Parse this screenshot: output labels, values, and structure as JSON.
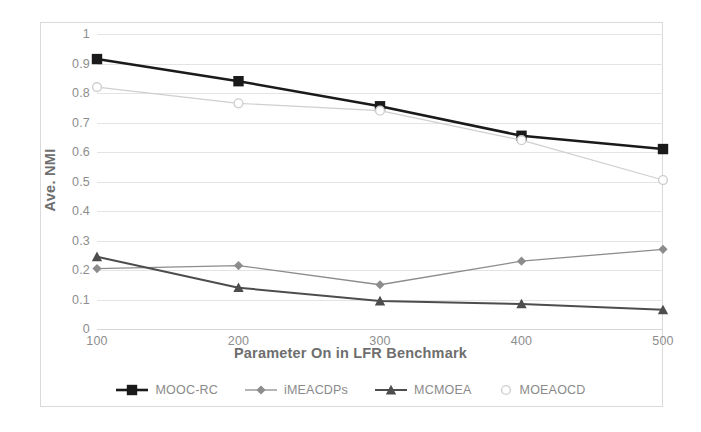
{
  "chart_data": {
    "type": "line",
    "title": "",
    "xlabel": "Parameter On in LFR Benchmark",
    "ylabel": "Ave. NMI",
    "x": [
      100,
      200,
      300,
      400,
      500
    ],
    "categories": [
      "100",
      "200",
      "300",
      "400",
      "500"
    ],
    "xtick_labels": [
      "100",
      "200",
      "300",
      "400",
      "500"
    ],
    "ytick_labels": [
      "0",
      "0.1",
      "0.2",
      "0.3",
      "0.4",
      "0.5",
      "0.6",
      "0.7",
      "0.8",
      "0.9",
      "1"
    ],
    "ylim": [
      0,
      1
    ],
    "xlim": [
      100,
      500
    ],
    "grid": true,
    "legend_position": "bottom",
    "series": [
      {
        "name": "MOOC-RC",
        "values": [
          0.915,
          0.84,
          0.755,
          0.655,
          0.61
        ],
        "color": "#1a1a1a",
        "marker": "square"
      },
      {
        "name": "iMEACDPs",
        "values": [
          0.205,
          0.215,
          0.15,
          0.23,
          0.27
        ],
        "color": "#8c8c8c",
        "marker": "diamond"
      },
      {
        "name": "MCMOEA",
        "values": [
          0.245,
          0.14,
          0.095,
          0.085,
          0.065
        ],
        "color": "#4d4d4d",
        "marker": "triangle"
      },
      {
        "name": "MOEAOCD",
        "values": [
          0.82,
          0.765,
          0.74,
          0.64,
          0.505
        ],
        "color": "#cfcfcf",
        "marker": "circle"
      }
    ]
  },
  "axes": {
    "y_title": "Ave. NMI",
    "x_title": "Parameter On in LFR Benchmark",
    "y_ticks": [
      "1",
      "0.9",
      "0.8",
      "0.7",
      "0.6",
      "0.5",
      "0.4",
      "0.3",
      "0.2",
      "0.1",
      "0"
    ],
    "x_ticks": [
      "100",
      "200",
      "300",
      "400",
      "500"
    ]
  },
  "legend": {
    "items": [
      {
        "label": "MOOC-RC",
        "marker": "square",
        "color": "#1a1a1a",
        "has_line": true
      },
      {
        "label": "iMEACDPs",
        "marker": "diamond",
        "color": "#8c8c8c",
        "has_line": true
      },
      {
        "label": "MCMOEA",
        "marker": "triangle",
        "color": "#4d4d4d",
        "has_line": true
      },
      {
        "label": "MOEAOCD",
        "marker": "circle",
        "color": "#cfcfcf",
        "has_line": false
      }
    ]
  }
}
